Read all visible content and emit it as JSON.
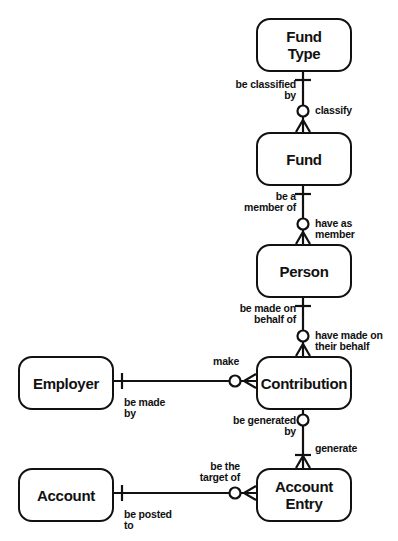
{
  "entities": {
    "fund_type": "Fund\nType",
    "fund": "Fund",
    "person": "Person",
    "contribution": "Contribution",
    "employer": "Employer",
    "account": "Account",
    "account_entry": "Account\nEntry"
  },
  "relationships": [
    {
      "from": "Fund",
      "to": "Fund Type",
      "from_label": "be classified\nby",
      "to_label": "classify",
      "from_cardinality": "one-and-only-one",
      "to_cardinality": "zero-or-many"
    },
    {
      "from": "Person",
      "to": "Fund",
      "from_label": "be a\nmember of",
      "to_label": "have as\nmember",
      "from_cardinality": "one-and-only-one",
      "to_cardinality": "zero-or-many"
    },
    {
      "from": "Contribution",
      "to": "Person",
      "from_label": "be made on\nbehalf of",
      "to_label": "have made on\ntheir behalf",
      "from_cardinality": "one-and-only-one",
      "to_cardinality": "zero-or-many"
    },
    {
      "from": "Contribution",
      "to": "Employer",
      "from_label": "be made\nby",
      "to_label": "make",
      "from_cardinality": "one-and-only-one",
      "to_cardinality": "zero-or-many"
    },
    {
      "from": "Account Entry",
      "to": "Contribution",
      "from_label": "be generated\nby",
      "to_label": "generate",
      "from_cardinality": "zero-or-one",
      "to_cardinality": "one-or-many"
    },
    {
      "from": "Account Entry",
      "to": "Account",
      "from_label": "be posted\nto",
      "to_label": "be the\ntarget of",
      "from_cardinality": "one-and-only-one",
      "to_cardinality": "zero-or-many"
    }
  ],
  "labels": {
    "be_classified_by": "be classified\nby",
    "classify": "classify",
    "be_a_member_of": "be a\nmember of",
    "have_as_member": "have as\nmember",
    "be_made_on_behalf_of": "be made on\nbehalf of",
    "have_made_on_their_behalf": "have made on\ntheir behalf",
    "make": "make",
    "be_made_by": "be made\nby",
    "be_generated_by": "be generated\nby",
    "generate": "generate",
    "be_the_target_of": "be the\ntarget of",
    "be_posted_to": "be posted\nto"
  },
  "colors": {
    "line": "#111111",
    "background": "#ffffff"
  }
}
